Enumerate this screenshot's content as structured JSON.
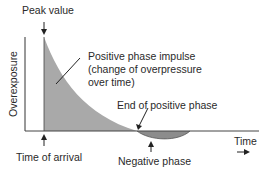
{
  "diagram": {
    "y_axis_label": "Overexposure",
    "x_axis_label": "Time",
    "annotations": {
      "peak_value": "Peak value",
      "positive_phase_line1": "Positive phase impulse",
      "positive_phase_line2": "(change of overpressure",
      "positive_phase_line3": "over time)",
      "end_positive": "End of positive phase",
      "time_of_arrival": "Time of arrival",
      "negative_phase": "Negative phase"
    },
    "colors": {
      "positive_fill": "#a9a9a9",
      "negative_fill": "#8c8c8c",
      "axis": "#333333"
    }
  }
}
